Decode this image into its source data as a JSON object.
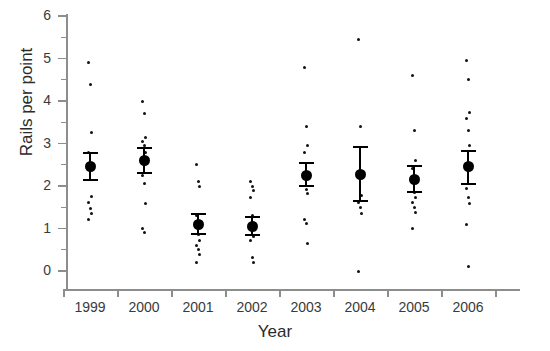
{
  "chart_data": {
    "type": "scatter",
    "title": "",
    "xlabel": "Year",
    "ylabel": "Rails per point",
    "categories": [
      "1999",
      "2000",
      "2001",
      "2002",
      "2003",
      "2004",
      "2005",
      "2006"
    ],
    "ylim": [
      0,
      6
    ],
    "y_ticks_major": [
      0,
      1,
      2,
      3,
      4,
      5,
      6
    ],
    "y_ticks_minor": [
      0.5,
      1.5,
      2.5,
      3.5,
      4.5,
      5.5
    ],
    "grid": false,
    "legend": "none",
    "marker_mean": "filled-circle-with-error-bars",
    "marker_raw": "small-dot",
    "series": [
      {
        "name": "1999",
        "mean": 2.45,
        "err_low": 2.15,
        "err_high": 2.78,
        "points": [
          4.9,
          4.4,
          3.25,
          2.8,
          2.45,
          1.75,
          1.62,
          1.48,
          1.35,
          1.22
        ]
      },
      {
        "name": "2000",
        "mean": 2.6,
        "err_low": 2.3,
        "err_high": 2.9,
        "points": [
          4.0,
          3.7,
          3.15,
          3.05,
          2.95,
          2.78,
          2.25,
          2.05,
          1.6,
          1.0,
          0.9
        ]
      },
      {
        "name": "2001",
        "mean": 1.1,
        "err_low": 0.88,
        "err_high": 1.35,
        "points": [
          2.5,
          2.1,
          2.0,
          1.3,
          0.85,
          0.72,
          0.6,
          0.5,
          0.38,
          0.2
        ]
      },
      {
        "name": "2002",
        "mean": 1.05,
        "err_low": 0.85,
        "err_high": 1.28,
        "points": [
          2.1,
          2.0,
          1.9,
          1.72,
          1.3,
          0.82,
          0.72,
          0.32,
          0.2
        ]
      },
      {
        "name": "2003",
        "mean": 2.25,
        "err_low": 2.0,
        "err_high": 2.55,
        "points": [
          4.8,
          3.4,
          2.95,
          2.8,
          1.92,
          1.82,
          1.22,
          1.12,
          0.65
        ]
      },
      {
        "name": "2004",
        "mean": 2.27,
        "err_low": 1.65,
        "err_high": 2.92,
        "points": [
          5.45,
          3.4,
          1.78,
          1.62,
          1.5,
          1.35,
          0.0
        ]
      },
      {
        "name": "2005",
        "mean": 2.15,
        "err_low": 1.85,
        "err_high": 2.48,
        "points": [
          4.6,
          3.3,
          2.6,
          2.42,
          1.85,
          1.72,
          1.62,
          1.5,
          1.38,
          1.0
        ]
      },
      {
        "name": "2006",
        "mean": 2.45,
        "err_low": 2.05,
        "err_high": 2.82,
        "points": [
          4.95,
          4.5,
          3.72,
          3.6,
          3.3,
          2.95,
          1.95,
          1.72,
          1.6,
          1.1,
          0.1
        ]
      }
    ]
  },
  "axes": {
    "y_title": "Rails per point",
    "x_title": "Year",
    "y_tick_labels": [
      "6",
      "5",
      "4",
      "3",
      "2",
      "1",
      "0"
    ],
    "x_tick_labels": [
      "1999",
      "2000",
      "2001",
      "2002",
      "2003",
      "2004",
      "2005",
      "2006"
    ]
  },
  "colors": {
    "marker": "#000000",
    "axis": "#8d8d8d",
    "text": "#2b2b2b",
    "background": "#ffffff"
  }
}
